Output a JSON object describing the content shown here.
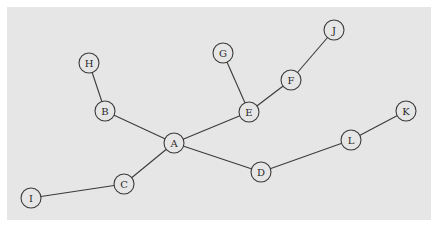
{
  "diagram": {
    "type": "tree-graph",
    "background": "#e6e6e6",
    "nodes": [
      {
        "id": "A",
        "label": "A",
        "x": 174,
        "y": 143
      },
      {
        "id": "B",
        "label": "B",
        "x": 105,
        "y": 111
      },
      {
        "id": "C",
        "label": "C",
        "x": 124,
        "y": 184
      },
      {
        "id": "D",
        "label": "D",
        "x": 261,
        "y": 172
      },
      {
        "id": "E",
        "label": "E",
        "x": 249,
        "y": 112
      },
      {
        "id": "F",
        "label": "F",
        "x": 291,
        "y": 80
      },
      {
        "id": "G",
        "label": "G",
        "x": 223,
        "y": 53
      },
      {
        "id": "H",
        "label": "H",
        "x": 89,
        "y": 63
      },
      {
        "id": "I",
        "label": "I",
        "x": 31,
        "y": 198
      },
      {
        "id": "J",
        "label": "J",
        "x": 334,
        "y": 30
      },
      {
        "id": "K",
        "label": "K",
        "x": 406,
        "y": 111
      },
      {
        "id": "L",
        "label": "L",
        "x": 351,
        "y": 140
      }
    ],
    "edges": [
      [
        "H",
        "B"
      ],
      [
        "B",
        "A"
      ],
      [
        "A",
        "C"
      ],
      [
        "C",
        "I"
      ],
      [
        "A",
        "E"
      ],
      [
        "E",
        "G"
      ],
      [
        "E",
        "F"
      ],
      [
        "F",
        "J"
      ],
      [
        "A",
        "D"
      ],
      [
        "D",
        "L"
      ],
      [
        "L",
        "K"
      ]
    ]
  }
}
